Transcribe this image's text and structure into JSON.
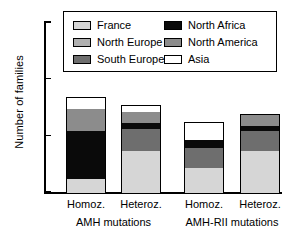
{
  "chart_data": {
    "type": "bar",
    "subtype": "stacked",
    "title": "",
    "xlabel": "",
    "ylabel": "Number of families",
    "ylim": [
      0,
      30
    ],
    "yticks": [
      0,
      10,
      20,
      30
    ],
    "ytick_labels": [
      "0",
      "10",
      "20",
      "30"
    ],
    "grid": false,
    "legend_position": "top-center",
    "categories": [
      "Homoz.",
      "Heteroz.",
      "Homoz.",
      "Heteroz."
    ],
    "groups": [
      {
        "label": "AMH mutations",
        "categories": [
          "Homoz.",
          "Heteroz."
        ]
      },
      {
        "label": "AMH-RII mutations",
        "categories": [
          "Homoz.",
          "Heteroz."
        ]
      }
    ],
    "series": [
      {
        "name": "France",
        "color": "#d6d6d6",
        "values": [
          2.5,
          7.5,
          4.5,
          7.5
        ]
      },
      {
        "name": "North Europe",
        "color": "#b0b0b0",
        "values": [
          0,
          0,
          0,
          0
        ]
      },
      {
        "name": "South Europe",
        "color": "#6e6e6e",
        "values": [
          0,
          4.0,
          3.5,
          3.5
        ]
      },
      {
        "name": "North Africa",
        "color": "#0a0a0a",
        "values": [
          8.5,
          1.0,
          1.5,
          0.9
        ]
      },
      {
        "name": "North America",
        "color": "#8c8c8c",
        "values": [
          4.0,
          2.0,
          0,
          2.1
        ]
      },
      {
        "name": "Asia",
        "color": "#ffffff",
        "values": [
          2.0,
          1.0,
          3.0,
          0
        ]
      }
    ],
    "totals": [
      17.0,
      15.5,
      12.5,
      14.0
    ],
    "legend": [
      {
        "label": "France",
        "color": "#d6d6d6"
      },
      {
        "label": "North Europe",
        "color": "#b0b0b0"
      },
      {
        "label": "South Europe",
        "color": "#6e6e6e"
      },
      {
        "label": "North Africa",
        "color": "#0a0a0a"
      },
      {
        "label": "North America",
        "color": "#8c8c8c"
      },
      {
        "label": "Asia",
        "color": "#ffffff"
      }
    ]
  }
}
